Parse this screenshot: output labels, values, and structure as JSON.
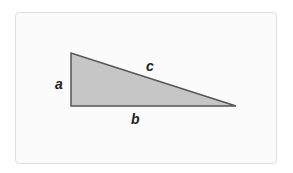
{
  "diagram": {
    "type": "right-triangle",
    "labels": {
      "a": "a",
      "b": "b",
      "c": "c"
    },
    "vertices": {
      "top": [
        71,
        53
      ],
      "right_angle": [
        71,
        106
      ],
      "far": [
        236,
        106
      ]
    },
    "colors": {
      "fill": "#c6c6c6",
      "stroke": "#555555",
      "card_bg": "#fbfbfb",
      "card_border": "#dedede"
    }
  }
}
